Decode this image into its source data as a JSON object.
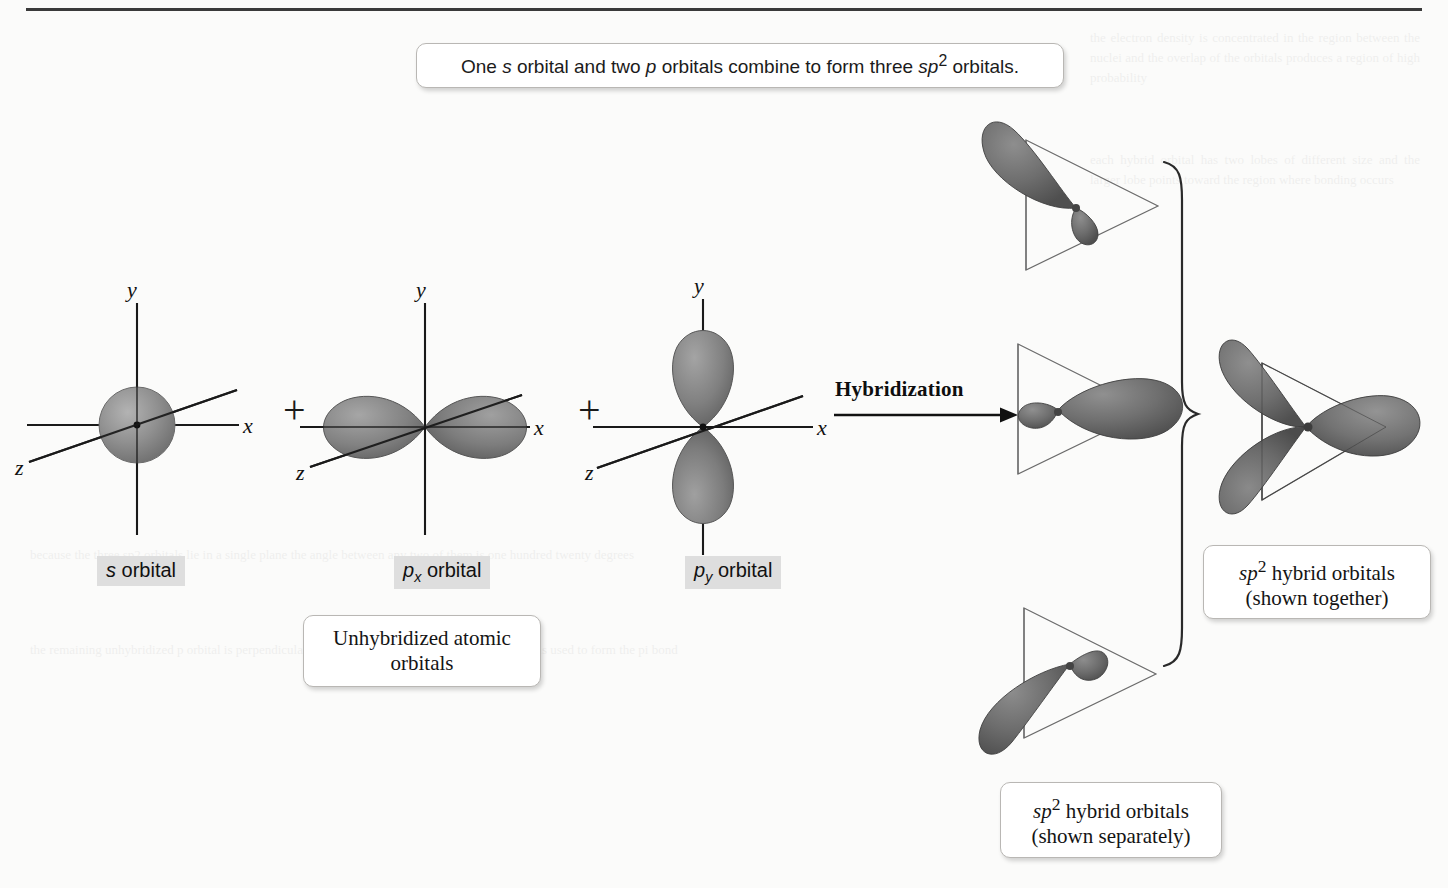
{
  "figure": {
    "top_caption": "One s orbital and two p orbitals combine to form three sp2 orbitals.",
    "top_caption_parts": {
      "a": "One ",
      "s_italic": "s",
      "b": " orbital and two ",
      "p_italic": "p",
      "c": " orbitals combine to form three ",
      "sp_italic": "sp",
      "superscript": "2",
      "d": " orbitals."
    }
  },
  "axes": {
    "x_label": "x",
    "y_label": "y",
    "z_label": "z"
  },
  "operators": {
    "plus_1": "+",
    "plus_2": "+",
    "arrow": "→"
  },
  "process": {
    "arrow_label": "Hybridization"
  },
  "orbitals": {
    "s": {
      "name_prefix": "s",
      "name_suffix": " orbital",
      "shape": "sphere",
      "lobes": 1
    },
    "px": {
      "name_prefix": "p",
      "name_subscript": "x",
      "name_suffix": " orbital",
      "shape": "dumbbell-horizontal",
      "lobes": 2
    },
    "py": {
      "name_prefix": "p",
      "name_subscript": "y",
      "name_suffix": " orbital",
      "shape": "dumbbell-vertical",
      "lobes": 2
    }
  },
  "labels": {
    "unhybridized": {
      "line1": "Unhybridized atomic",
      "line2": "orbitals"
    },
    "hybrid_together": {
      "line1_italic": "sp",
      "line1_sup": "2",
      "line1_rest": " hybrid orbitals",
      "line2": "(shown together)"
    },
    "hybrid_separate": {
      "line1_italic": "sp",
      "line1_sup": "2",
      "line1_rest": " hybrid orbitals",
      "line2": "(shown separately)"
    }
  },
  "hybrid_set": {
    "count": 3,
    "geometry": "trigonal planar",
    "bond_angle_degrees": 120,
    "plane_outline": "triangle",
    "separate_orientations": [
      {
        "id": "top",
        "angle_degrees": 90,
        "description": "upper-left large lobe"
      },
      {
        "id": "middle",
        "angle_degrees": 0,
        "description": "right-pointing large lobe"
      },
      {
        "id": "bottom",
        "angle_degrees": 210,
        "description": "lower-left large lobe"
      }
    ]
  },
  "colors": {
    "orbital_fill": "#8a8a8a",
    "orbital_fill_dark": "#6d6d6d",
    "orbital_edge": "#4a4a4a",
    "axis_line": "#1a1a1a",
    "triangle_outline": "#6b6b6b",
    "callout_border": "#b9b7b4",
    "highlight_bg": "#dedede",
    "page_bg": "#fbfbfa",
    "rule": "#3a3a3a"
  },
  "ghost_text": {
    "blocks": [
      "the electron density is concentrated in the region between the nuclei and the overlap of the orbitals produces a region of high probability",
      "each hybrid orbital has two lobes of different size and the larger lobe points toward the region where bonding occurs",
      "because the three sp2 orbitals lie in a single plane the angle between any two of them is one hundred twenty degrees",
      "the remaining unhybridized p orbital is perpendicular to the plane of the three hybrid orbitals and is used to form the pi bond"
    ]
  }
}
